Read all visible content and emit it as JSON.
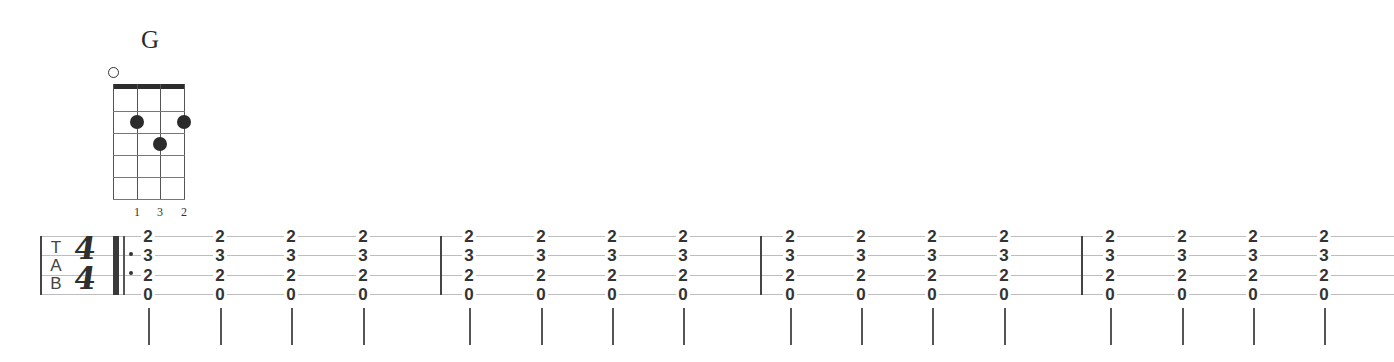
{
  "chord_diagram": {
    "name": "G",
    "open_strings": [
      "open-string-1"
    ],
    "fingers": [
      "1",
      "3",
      "2"
    ],
    "dots": [
      {
        "string": 2,
        "fret": 2,
        "finger": "1"
      },
      {
        "string": 3,
        "fret": 3,
        "finger": "3"
      },
      {
        "string": 4,
        "fret": 2,
        "finger": "2"
      }
    ]
  },
  "staff": {
    "clef": {
      "t": "T",
      "a": "A",
      "b": "B"
    },
    "time_signature": {
      "top": "4",
      "bottom": "4"
    },
    "measures": [
      {
        "chords": [
          [
            "2",
            "3",
            "2",
            "0"
          ],
          [
            "2",
            "3",
            "2",
            "0"
          ],
          [
            "2",
            "3",
            "2",
            "0"
          ],
          [
            "2",
            "3",
            "2",
            "0"
          ]
        ]
      },
      {
        "chords": [
          [
            "2",
            "3",
            "2",
            "0"
          ],
          [
            "2",
            "3",
            "2",
            "0"
          ],
          [
            "2",
            "3",
            "2",
            "0"
          ],
          [
            "2",
            "3",
            "2",
            "0"
          ]
        ]
      },
      {
        "chords": [
          [
            "2",
            "3",
            "2",
            "0"
          ],
          [
            "2",
            "3",
            "2",
            "0"
          ],
          [
            "2",
            "3",
            "2",
            "0"
          ],
          [
            "2",
            "3",
            "2",
            "0"
          ]
        ]
      },
      {
        "chords": [
          [
            "2",
            "3",
            "2",
            "0"
          ],
          [
            "2",
            "3",
            "2",
            "0"
          ],
          [
            "2",
            "3",
            "2",
            "0"
          ],
          [
            "2",
            "3",
            "2",
            "0"
          ]
        ]
      }
    ]
  }
}
